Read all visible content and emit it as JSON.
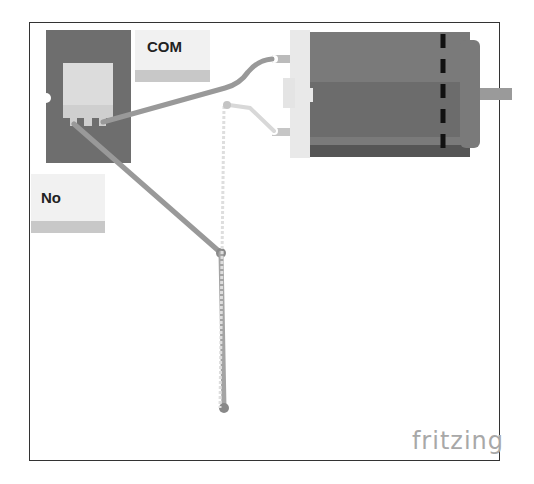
{
  "diagram": {
    "type": "breadboard wiring diagram",
    "labels": {
      "com": "COM",
      "no": "No"
    },
    "components": [
      {
        "name": "relay",
        "description": "relay module with pins"
      },
      {
        "name": "dc-motor",
        "description": "DC motor with two terminals"
      }
    ],
    "watermark": "fritzing",
    "colors": {
      "relay_body": "#6e6e6e",
      "relay_window": "#dcdcdc",
      "motor_body": "#7a7a7a",
      "motor_dark": "#5e5e5e",
      "wire_dark": "#999999",
      "wire_light": "#d8d8d8",
      "dash": "#111111"
    }
  }
}
